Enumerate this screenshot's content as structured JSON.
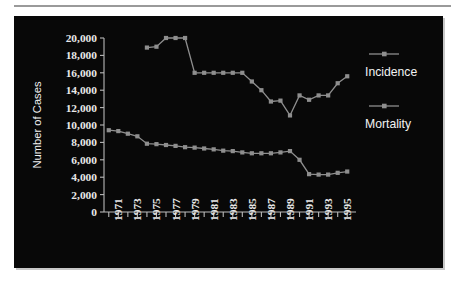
{
  "chart_data": {
    "type": "line",
    "title": "",
    "xlabel": "",
    "ylabel": "Number of Cases",
    "x": [
      1970,
      1971,
      1972,
      1973,
      1974,
      1975,
      1976,
      1977,
      1978,
      1979,
      1980,
      1981,
      1982,
      1983,
      1984,
      1985,
      1986,
      1987,
      1988,
      1989,
      1990,
      1991,
      1992,
      1993,
      1994,
      1995
    ],
    "xlim": [
      1969.5,
      1995.5
    ],
    "ylim": [
      0,
      20000
    ],
    "grid": false,
    "legend_position": "right",
    "ytick_labels": [
      "0",
      "2,000",
      "4,000",
      "6,000",
      "8,000",
      "10,000",
      "12,000",
      "14,000",
      "16,000",
      "18,000",
      "20,000"
    ],
    "ytick_values": [
      0,
      2000,
      4000,
      6000,
      8000,
      10000,
      12000,
      14000,
      16000,
      18000,
      20000
    ],
    "xtick_labels": [
      "1971",
      "1973",
      "1975",
      "1977",
      "1979",
      "1981",
      "1983",
      "1985",
      "1987",
      "1989",
      "1991",
      "1993",
      "1995"
    ],
    "xtick_values": [
      1971,
      1973,
      1975,
      1977,
      1979,
      1981,
      1983,
      1985,
      1987,
      1989,
      1991,
      1993,
      1995
    ],
    "series": [
      {
        "name": "Incidence",
        "color": "#8e8e8e",
        "x": [
          1974,
          1975,
          1976,
          1977,
          1978,
          1979,
          1980,
          1981,
          1982,
          1983,
          1984,
          1985,
          1986,
          1987,
          1988,
          1989,
          1990,
          1991,
          1992,
          1993,
          1994,
          1995
        ],
        "values": [
          18900,
          19000,
          20000,
          20000,
          20000,
          16000,
          16000,
          16000,
          16000,
          16000,
          16000,
          15000,
          14000,
          12700,
          12800,
          11100,
          13400,
          12900,
          13400,
          13400,
          14800,
          15600
        ]
      },
      {
        "name": "Mortality",
        "color": "#8e8e8e",
        "x": [
          1970,
          1971,
          1972,
          1973,
          1974,
          1975,
          1976,
          1977,
          1978,
          1979,
          1980,
          1981,
          1982,
          1983,
          1984,
          1985,
          1986,
          1987,
          1988,
          1989,
          1990,
          1991,
          1992,
          1993,
          1994,
          1995
        ],
        "values": [
          9400,
          9300,
          9000,
          8700,
          7850,
          7800,
          7700,
          7600,
          7450,
          7400,
          7300,
          7200,
          7050,
          7000,
          6850,
          6750,
          6750,
          6750,
          6850,
          7000,
          6000,
          4350,
          4300,
          4300,
          4500,
          4650
        ]
      }
    ]
  },
  "legend": {
    "items": [
      {
        "label": "Incidence"
      },
      {
        "label": "Mortality"
      }
    ]
  },
  "axes": {
    "y_title": "Number of Cases"
  }
}
